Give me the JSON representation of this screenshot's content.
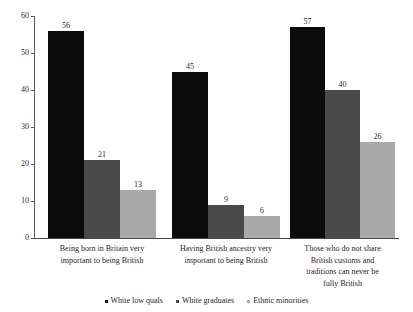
{
  "chart_data": {
    "type": "bar",
    "title": "",
    "subtitle": "",
    "xlabel": "",
    "ylabel": "",
    "ylim": [
      0,
      60
    ],
    "yticks": [
      0,
      10,
      20,
      30,
      40,
      50,
      60
    ],
    "grid": false,
    "legend_position": "bottom",
    "categories": [
      "Being born in Britain very important to being British",
      "Having British ancestry very important to being British",
      "Those who do not share British customs and traditions can never be fully British"
    ],
    "category_lines": [
      [
        "Being born in Britain very",
        "important to being British"
      ],
      [
        "Having British ancestry very",
        "important to being British"
      ],
      [
        "Those who do not share",
        "British customs and",
        "traditions can never be",
        "fully British"
      ]
    ],
    "series": [
      {
        "name": "White low quals",
        "color": "#0b0b0b",
        "values": [
          56,
          45,
          57
        ]
      },
      {
        "name": "White graduates",
        "color": "#4a4a4a",
        "values": [
          21,
          9,
          40
        ]
      },
      {
        "name": "Ethnic minorities",
        "color": "#a9a9a9",
        "values": [
          13,
          6,
          26
        ]
      }
    ],
    "axis_color": "#4a4a4a",
    "background": "#ffffff"
  }
}
